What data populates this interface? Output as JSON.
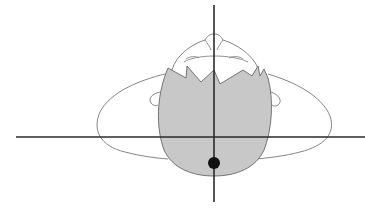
{
  "figure": {
    "colors": {
      "background": "#ffffff",
      "outline": "#555555",
      "hair_fill": "#c8c8c8",
      "axis": "#2a2a2a",
      "marker": "#111111"
    },
    "axes": {
      "horizontal": {
        "x1": 16,
        "x2": 365,
        "y": 137
      },
      "vertical": {
        "x": 214,
        "y1": 5,
        "y2": 202
      }
    },
    "marker": {
      "cx": 214,
      "cy": 163,
      "r": 6
    }
  }
}
